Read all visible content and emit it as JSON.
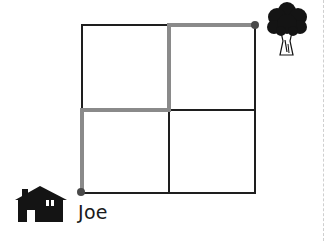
{
  "diagram": {
    "type": "grid-path",
    "grid": {
      "rows": 2,
      "cols": 2,
      "x0": 82,
      "y0": 25,
      "x1": 255,
      "y1": 193
    },
    "colors": {
      "grid_line": "#1e1e1e",
      "path": "#8a8a8a",
      "dot": "#555555",
      "icon": "#141414"
    },
    "start": {
      "label": "Joe",
      "icon": "house-icon"
    },
    "end": {
      "icon": "tree-icon"
    },
    "path_points": [
      [
        82,
        193
      ],
      [
        82,
        110
      ],
      [
        169,
        110
      ],
      [
        169,
        25
      ],
      [
        255,
        25
      ]
    ]
  }
}
